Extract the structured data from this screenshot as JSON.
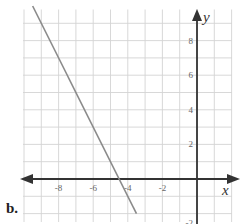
{
  "part_label": "b.",
  "chart_data": {
    "type": "line",
    "title": "",
    "xlabel": "x",
    "ylabel": "y",
    "xlim": [
      -10,
      2
    ],
    "ylim": [
      -2.5,
      10
    ],
    "grid": true,
    "x_ticks": [
      -8,
      -6,
      -4,
      -2
    ],
    "y_ticks": [
      2,
      4,
      6,
      8
    ],
    "y_tick_partial": "-2",
    "series": [
      {
        "name": "line",
        "equation": "y = -2x - 9",
        "x": [
          -9.5,
          -3.5
        ],
        "y": [
          10,
          -2
        ],
        "color": "#8a8a8a"
      }
    ],
    "axes_color": "#333333",
    "grid_color": "#d4d4d4"
  }
}
